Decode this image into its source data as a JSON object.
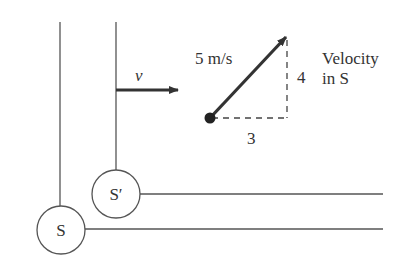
{
  "diagram": {
    "colors": {
      "line": "#555555",
      "arrow": "#333333",
      "text": "#333333",
      "background": "#ffffff"
    },
    "frames": [
      {
        "id": "S",
        "label": "S"
      },
      {
        "id": "S_prime",
        "label": "S′"
      }
    ],
    "frame_velocity_label": "v",
    "velocity": {
      "magnitude_label": "5 m/s",
      "x_component_label": "3",
      "y_component_label": "4",
      "caption_line1": "Velocity",
      "caption_line2": "in S"
    }
  }
}
